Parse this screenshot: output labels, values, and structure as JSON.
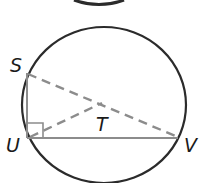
{
  "diagram": {
    "title": "",
    "colors": {
      "circle": "#2b2b2b",
      "segment": "#8c8c8c",
      "dashed": "#8c8c8c",
      "label": "#1a1a1a",
      "background": "#ffffff"
    },
    "points": {
      "S": {
        "label": "S",
        "x": 27,
        "y": 73
      },
      "U": {
        "label": "U",
        "x": 27,
        "y": 138
      },
      "V": {
        "label": "V",
        "x": 178,
        "y": 138
      },
      "T": {
        "label": "T",
        "x": 102,
        "y": 103
      }
    },
    "labels": {
      "S": "S",
      "U": "U",
      "T": "T",
      "V": "V"
    },
    "segments": [
      {
        "from": "S",
        "to": "U",
        "style": "solid"
      },
      {
        "from": "U",
        "to": "V",
        "style": "solid"
      },
      {
        "from": "S",
        "to": "V",
        "style": "dashed"
      },
      {
        "from": "U",
        "to": "T",
        "style": "dashed"
      }
    ],
    "right_angle_at": "U",
    "circle": {
      "cx": 104,
      "cy": 105,
      "rx": 82,
      "ry": 78
    }
  }
}
